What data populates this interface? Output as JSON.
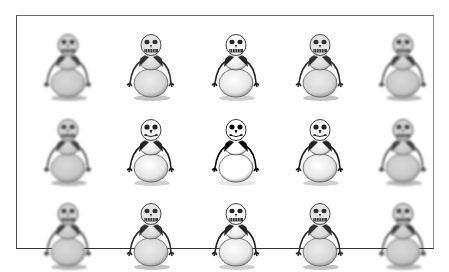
{
  "puzzle": {
    "frame": {
      "left": 16,
      "top": 15,
      "right": 433,
      "bottom": 248
    },
    "grid": {
      "rows": 3,
      "cols": 5
    },
    "cells": [
      {
        "row": 0,
        "col": 0,
        "x": 22,
        "y": 12,
        "variant": "blurred",
        "face": "toothy"
      },
      {
        "row": 0,
        "col": 1,
        "x": 105,
        "y": 12,
        "variant": "soft",
        "face": "toothy"
      },
      {
        "row": 0,
        "col": 2,
        "x": 190,
        "y": 12,
        "variant": "normal",
        "face": "toothy"
      },
      {
        "row": 0,
        "col": 3,
        "x": 274,
        "y": 12,
        "variant": "soft",
        "face": "toothy"
      },
      {
        "row": 0,
        "col": 4,
        "x": 357,
        "y": 12,
        "variant": "blurred",
        "face": "toothy"
      },
      {
        "row": 1,
        "col": 0,
        "x": 22,
        "y": 97,
        "variant": "blurred",
        "face": "toothy"
      },
      {
        "row": 1,
        "col": 1,
        "x": 105,
        "y": 97,
        "variant": "normal",
        "face": "dots"
      },
      {
        "row": 1,
        "col": 2,
        "x": 190,
        "y": 97,
        "variant": "sharp",
        "face": "dots"
      },
      {
        "row": 1,
        "col": 3,
        "x": 274,
        "y": 97,
        "variant": "normal",
        "face": "dots"
      },
      {
        "row": 1,
        "col": 4,
        "x": 357,
        "y": 97,
        "variant": "blurred",
        "face": "toothy"
      },
      {
        "row": 2,
        "col": 0,
        "x": 22,
        "y": 181,
        "variant": "blurred",
        "face": "toothy"
      },
      {
        "row": 2,
        "col": 1,
        "x": 105,
        "y": 181,
        "variant": "soft",
        "face": "toothy"
      },
      {
        "row": 2,
        "col": 2,
        "x": 190,
        "y": 181,
        "variant": "normal",
        "face": "toothy"
      },
      {
        "row": 2,
        "col": 3,
        "x": 274,
        "y": 181,
        "variant": "soft",
        "face": "toothy"
      },
      {
        "row": 2,
        "col": 4,
        "x": 357,
        "y": 181,
        "variant": "blurred",
        "face": "toothy"
      }
    ],
    "colors": {
      "ink": "#1a1a1a",
      "shade": "#9a9a9a",
      "body": "#f4f4f4",
      "border": "#4a4a4a"
    }
  }
}
